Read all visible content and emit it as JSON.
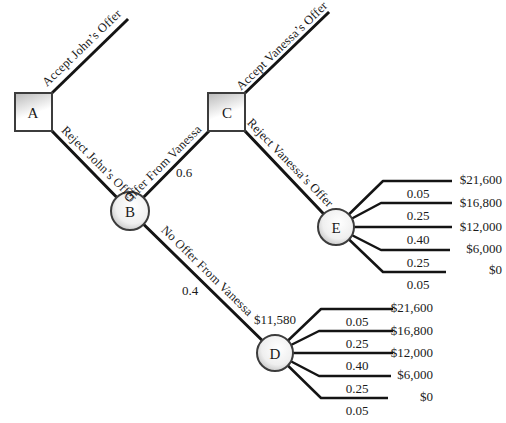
{
  "figure": {
    "nodes": {
      "a": "A",
      "b": "B",
      "c": "C",
      "d": "D",
      "e": "E"
    },
    "branches": {
      "accept_john": "Accept John’s Offer",
      "reject_john": "Reject John’s Offer",
      "offer_vanessa": "Offer From Vanessa",
      "offer_vanessa_prob": "0.6",
      "no_offer_vanessa": "No Offer From Vanessa",
      "no_offer_vanessa_prob": "0.4",
      "accept_vanessa": "Accept Vanessa’s Offer",
      "reject_vanessa": "Reject Vanessa’s Offer"
    },
    "d_value": "$11,580",
    "e_fan": [
      {
        "prob": "0.05",
        "payoff": "$21,600"
      },
      {
        "prob": "0.25",
        "payoff": "$16,800"
      },
      {
        "prob": "0.40",
        "payoff": "$12,000"
      },
      {
        "prob": "0.25",
        "payoff": "$6,000"
      },
      {
        "prob": "0.05",
        "payoff": "$0"
      }
    ],
    "d_fan": [
      {
        "prob": "0.05",
        "payoff": "$21,600"
      },
      {
        "prob": "0.25",
        "payoff": "$16,800"
      },
      {
        "prob": "0.40",
        "payoff": "$12,000"
      },
      {
        "prob": "0.25",
        "payoff": "$6,000"
      },
      {
        "prob": "0.05",
        "payoff": "$0"
      }
    ],
    "colors": {
      "line": "#141414",
      "node_border": "#3c3c3c",
      "node_fill_light": "#ffffff",
      "node_fill_shade": "#bdbdbd",
      "background": "#ffffff",
      "text": "#1a1a1a"
    }
  }
}
